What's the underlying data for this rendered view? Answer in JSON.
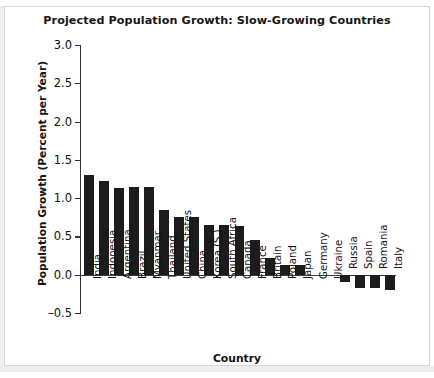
{
  "chart_data": {
    "type": "bar",
    "title": "Projected Population Growth: Slow-Growing Countries",
    "xlabel": "Country",
    "ylabel": "Population Growth (Percent per Year)",
    "ylim": [
      -0.5,
      3.0
    ],
    "yticks": [
      "3.0",
      "2.5",
      "2.0",
      "1.5",
      "1.0",
      "0.5",
      "0.0",
      "–0.5"
    ],
    "ytick_values": [
      3.0,
      2.5,
      2.0,
      1.5,
      1.0,
      0.5,
      0.0,
      -0.5
    ],
    "grid": false,
    "legend": "none",
    "bar_color": "#1c1c1c",
    "categories": [
      "India",
      "Indonesia",
      "Argentina",
      "Brazil",
      "Myanmar",
      "Thailand",
      "United States",
      "China",
      "Korea (S.)",
      "South Africa",
      "Canada",
      "France",
      "Britain",
      "Poland",
      "Japan",
      "Germany",
      "Ukraine",
      "Russia",
      "Spain",
      "Romania",
      "Italy"
    ],
    "values": [
      1.3,
      1.22,
      1.13,
      1.14,
      1.14,
      0.84,
      0.76,
      0.75,
      0.65,
      0.65,
      0.64,
      0.45,
      0.22,
      0.13,
      0.13,
      0.0,
      0.0,
      -0.1,
      -0.17,
      -0.17,
      -0.2
    ]
  }
}
